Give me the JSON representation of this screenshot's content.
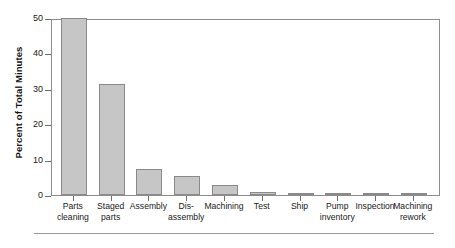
{
  "chart_data": {
    "type": "bar",
    "title": "",
    "xlabel": "",
    "ylabel": "Percent of Total Minutes",
    "ylim": [
      0,
      50
    ],
    "yticks": [
      0,
      10,
      20,
      30,
      40,
      50
    ],
    "grid": false,
    "legend": null,
    "categories": [
      "Parts\ncleaning",
      "Staged\nparts",
      "Assembly",
      "Dis-\nassembly",
      "Machining",
      "Test",
      "Ship",
      "Pump\ninventory",
      "Inspection",
      "Machining\nrework"
    ],
    "values": [
      50.0,
      31.4,
      7.3,
      5.5,
      2.7,
      0.8,
      0.5,
      0.5,
      0.5,
      0.5
    ],
    "bar_color": "#c6c6c6",
    "bar_edge_color": "#8a8a8a",
    "frame_color": "#8d8d8d"
  },
  "axis": {
    "y_title": "Percent of Total Minutes",
    "y_tick_labels": [
      "50",
      "40",
      "30",
      "20",
      "10",
      "0"
    ]
  }
}
